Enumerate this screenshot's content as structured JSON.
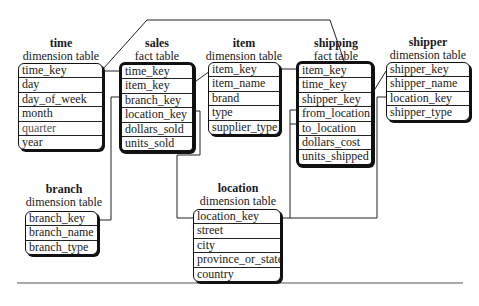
{
  "tables": {
    "time": {
      "name": "time",
      "kind": "dimension table",
      "fields": [
        "time_key",
        "day",
        "day_of_week",
        "month",
        "quarter",
        "year"
      ]
    },
    "sales": {
      "name": "sales",
      "kind": "fact table",
      "fields": [
        "time_key",
        "item_key",
        "branch_key",
        "location_key",
        "dollars_sold",
        "units_sold"
      ]
    },
    "item": {
      "name": "item",
      "kind": "dimension table",
      "fields": [
        "item_key",
        "item_name",
        "brand",
        "type",
        "supplier_type"
      ]
    },
    "shipping": {
      "name": "shipping",
      "kind": "fact table",
      "fields": [
        "item_key",
        "time_key",
        "shipper_key",
        "from_location",
        "to_location",
        "dollars_cost",
        "units_shipped"
      ]
    },
    "shipper": {
      "name": "shipper",
      "kind": "dimension table",
      "fields": [
        "shipper_key",
        "shipper_name",
        "location_key",
        "shipper_type"
      ]
    },
    "branch": {
      "name": "branch",
      "kind": "dimension table",
      "fields": [
        "branch_key",
        "branch_name",
        "branch_type"
      ]
    },
    "location": {
      "name": "location",
      "kind": "dimension table",
      "fields": [
        "location_key",
        "street",
        "city",
        "province_or_state",
        "country"
      ]
    }
  }
}
